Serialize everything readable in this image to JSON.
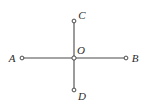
{
  "figure": {
    "name": "intersecting-segments-diagram",
    "background_color": "#ffffff",
    "line_color": "#4a4a4a",
    "label_color": "#2b2b2b",
    "marker_fill": "#ffffff",
    "marker_stroke": "#4a4a4a",
    "width": 147,
    "height": 105
  },
  "geometry": {
    "center": {
      "label": "O",
      "x": 74,
      "y": 58
    },
    "points": [
      {
        "id": "A",
        "label": "A",
        "x": 22,
        "y": 58,
        "label_x": 12,
        "label_y": 62,
        "marker": "open-circle"
      },
      {
        "id": "B",
        "label": "B",
        "x": 126,
        "y": 58,
        "label_x": 132,
        "label_y": 62,
        "marker": "open-circle"
      },
      {
        "id": "C",
        "label": "C",
        "x": 74,
        "y": 21,
        "label_x": 79,
        "label_y": 18,
        "marker": "open-circle"
      },
      {
        "id": "D",
        "label": "D",
        "x": 74,
        "y": 90,
        "label_x": 79,
        "label_y": 99,
        "marker": "open-circle"
      }
    ],
    "segments": [
      {
        "id": "AB",
        "from": "A",
        "to": "B",
        "x1": 22,
        "y1": 58,
        "x2": 126,
        "y2": 58
      },
      {
        "id": "CD",
        "from": "C",
        "to": "D",
        "x1": 74,
        "y1": 21,
        "x2": 74,
        "y2": 90
      }
    ],
    "center_label_x": 77,
    "center_label_y": 54
  },
  "labels": {
    "A": "A",
    "B": "B",
    "C": "C",
    "D": "D",
    "O": "O"
  }
}
